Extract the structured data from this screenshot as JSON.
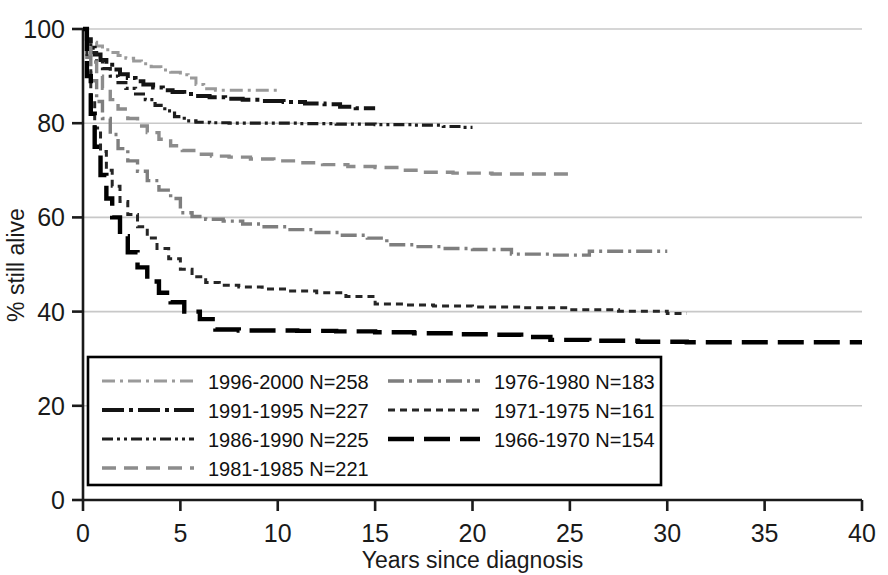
{
  "chart_data": {
    "type": "line",
    "title": "",
    "subtitle": "",
    "xlabel": "Years since diagnosis",
    "ylabel": "% still alive",
    "xlim": [
      0,
      40
    ],
    "ylim": [
      0,
      100
    ],
    "xticks": [
      0,
      5,
      10,
      15,
      20,
      25,
      30,
      35,
      40
    ],
    "yticks": [
      0,
      20,
      40,
      60,
      80,
      100
    ],
    "grid": "horizontal",
    "legend_position": "inside-bottom-left",
    "series": [
      {
        "name": "1996-2000 N=258",
        "period": "1996-2000",
        "n": 258,
        "dash": "dashdot",
        "color": "#9a9a9a",
        "width": 3.0,
        "points": [
          [
            0,
            100
          ],
          [
            0.2,
            98.5
          ],
          [
            0.4,
            97.2
          ],
          [
            0.7,
            96.4
          ],
          [
            1.0,
            95.6
          ],
          [
            1.4,
            95.0
          ],
          [
            1.8,
            94.4
          ],
          [
            2.2,
            93.8
          ],
          [
            2.6,
            93.2
          ],
          [
            3.0,
            92.6
          ],
          [
            3.5,
            92.0
          ],
          [
            4.0,
            91.3
          ],
          [
            4.5,
            90.8
          ],
          [
            5.0,
            90.3
          ],
          [
            5.4,
            89.6
          ],
          [
            5.8,
            88.2
          ],
          [
            6.2,
            87.3
          ],
          [
            6.8,
            87.0
          ],
          [
            7.5,
            87.0
          ],
          [
            8.5,
            87.0
          ],
          [
            9.4,
            87.0
          ],
          [
            10.0,
            87.0
          ]
        ]
      },
      {
        "name": "1991-1995 N=227",
        "period": "1991-1995",
        "n": 227,
        "dash": "longdashdot",
        "color": "#141414",
        "width": 4.0,
        "points": [
          [
            0,
            100
          ],
          [
            0.2,
            97.8
          ],
          [
            0.4,
            96.0
          ],
          [
            0.6,
            94.6
          ],
          [
            0.9,
            93.4
          ],
          [
            1.2,
            92.4
          ],
          [
            1.5,
            91.4
          ],
          [
            1.9,
            90.4
          ],
          [
            2.3,
            89.6
          ],
          [
            2.7,
            88.9
          ],
          [
            3.1,
            88.2
          ],
          [
            3.6,
            87.6
          ],
          [
            4.1,
            87.0
          ],
          [
            4.6,
            86.6
          ],
          [
            5.2,
            86.2
          ],
          [
            5.8,
            85.8
          ],
          [
            6.5,
            85.5
          ],
          [
            7.3,
            85.2
          ],
          [
            8.2,
            85.0
          ],
          [
            9.2,
            84.7
          ],
          [
            10.3,
            84.5
          ],
          [
            11.4,
            84.2
          ],
          [
            12.4,
            84.0
          ],
          [
            13.2,
            83.5
          ],
          [
            14.0,
            83.2
          ],
          [
            15.0,
            83.2
          ]
        ]
      },
      {
        "name": "1986-1990 N=225",
        "period": "1986-1990",
        "n": 225,
        "dash": "dashdotdot",
        "color": "#1d1d1d",
        "width": 3.2,
        "points": [
          [
            0,
            100
          ],
          [
            0.2,
            97.0
          ],
          [
            0.4,
            95.0
          ],
          [
            0.7,
            93.2
          ],
          [
            1.0,
            91.6
          ],
          [
            1.4,
            90.0
          ],
          [
            1.8,
            88.6
          ],
          [
            2.2,
            87.4
          ],
          [
            2.7,
            86.2
          ],
          [
            3.2,
            85.0
          ],
          [
            3.7,
            83.8
          ],
          [
            4.2,
            82.6
          ],
          [
            4.7,
            81.4
          ],
          [
            5.2,
            80.5
          ],
          [
            5.8,
            80.2
          ],
          [
            6.5,
            80.1
          ],
          [
            7.5,
            80.0
          ],
          [
            9.0,
            80.0
          ],
          [
            11.0,
            79.9
          ],
          [
            13.0,
            79.8
          ],
          [
            15.0,
            79.7
          ],
          [
            17.0,
            79.6
          ],
          [
            18.5,
            79.3
          ],
          [
            19.5,
            79.1
          ],
          [
            20.0,
            79.1
          ]
        ]
      },
      {
        "name": "1981-1985 N=221",
        "period": "1981-1985",
        "n": 221,
        "dash": "dashed",
        "color": "#8c8c8c",
        "width": 3.4,
        "points": [
          [
            0,
            100
          ],
          [
            0.2,
            96.0
          ],
          [
            0.4,
            93.0
          ],
          [
            0.7,
            90.0
          ],
          [
            1.0,
            87.4
          ],
          [
            1.4,
            85.0
          ],
          [
            1.8,
            83.0
          ],
          [
            2.3,
            81.0
          ],
          [
            2.8,
            79.4
          ],
          [
            3.3,
            78.0
          ],
          [
            3.9,
            76.6
          ],
          [
            4.5,
            75.2
          ],
          [
            5.1,
            74.2
          ],
          [
            5.8,
            73.4
          ],
          [
            6.6,
            73.0
          ],
          [
            7.5,
            72.8
          ],
          [
            8.6,
            72.4
          ],
          [
            9.8,
            72.0
          ],
          [
            11.0,
            71.6
          ],
          [
            12.3,
            71.2
          ],
          [
            13.6,
            70.8
          ],
          [
            15.0,
            70.6
          ],
          [
            16.3,
            70.0
          ],
          [
            17.5,
            69.6
          ],
          [
            19.0,
            69.4
          ],
          [
            21.0,
            69.2
          ],
          [
            23.0,
            69.2
          ],
          [
            25.0,
            69.2
          ]
        ]
      },
      {
        "name": "1976-1980 N=183",
        "period": "1976-1980",
        "n": 183,
        "dash": "dashdot-gray",
        "color": "#7e7e7e",
        "width": 3.4,
        "points": [
          [
            0,
            100
          ],
          [
            0.2,
            94.0
          ],
          [
            0.4,
            89.0
          ],
          [
            0.7,
            84.6
          ],
          [
            1.0,
            81.0
          ],
          [
            1.4,
            77.6
          ],
          [
            1.8,
            74.6
          ],
          [
            2.3,
            72.0
          ],
          [
            2.8,
            69.8
          ],
          [
            3.3,
            67.8
          ],
          [
            3.9,
            65.8
          ],
          [
            4.5,
            64.0
          ],
          [
            5.0,
            61.0
          ],
          [
            5.6,
            60.2
          ],
          [
            6.3,
            59.6
          ],
          [
            7.2,
            59.2
          ],
          [
            8.2,
            58.6
          ],
          [
            9.3,
            58.0
          ],
          [
            10.5,
            57.4
          ],
          [
            11.8,
            56.8
          ],
          [
            13.2,
            56.2
          ],
          [
            14.6,
            55.6
          ],
          [
            15.6,
            54.2
          ],
          [
            17.0,
            53.8
          ],
          [
            18.5,
            53.4
          ],
          [
            20.0,
            53.2
          ],
          [
            22.0,
            52.2
          ],
          [
            24.0,
            52.0
          ],
          [
            26.0,
            52.8
          ],
          [
            28.0,
            52.8
          ],
          [
            30.0,
            52.8
          ]
        ]
      },
      {
        "name": "1971-1975 N=161",
        "period": "1971-1975",
        "n": 161,
        "dash": "dotted",
        "color": "#262626",
        "width": 3.0,
        "points": [
          [
            0,
            100
          ],
          [
            0.2,
            92.0
          ],
          [
            0.4,
            85.0
          ],
          [
            0.6,
            79.0
          ],
          [
            0.9,
            74.0
          ],
          [
            1.2,
            70.0
          ],
          [
            1.5,
            66.6
          ],
          [
            1.9,
            63.4
          ],
          [
            2.3,
            60.6
          ],
          [
            2.8,
            58.0
          ],
          [
            3.3,
            55.6
          ],
          [
            3.8,
            53.4
          ],
          [
            4.4,
            51.2
          ],
          [
            5.0,
            49.0
          ],
          [
            5.6,
            47.4
          ],
          [
            6.3,
            46.2
          ],
          [
            7.0,
            45.6
          ],
          [
            8.0,
            45.2
          ],
          [
            9.2,
            44.8
          ],
          [
            10.5,
            44.4
          ],
          [
            12.0,
            44.0
          ],
          [
            13.5,
            43.2
          ],
          [
            15.0,
            41.6
          ],
          [
            16.5,
            41.4
          ],
          [
            18.0,
            41.2
          ],
          [
            20.0,
            41.0
          ],
          [
            22.5,
            40.8
          ],
          [
            25.0,
            40.4
          ],
          [
            27.5,
            40.1
          ],
          [
            30.0,
            39.6
          ],
          [
            31.0,
            39.6
          ]
        ]
      },
      {
        "name": "1966-1970 N=154",
        "period": "1966-1970",
        "n": 154,
        "dash": "longdash",
        "color": "#000000",
        "width": 4.4,
        "points": [
          [
            0,
            100
          ],
          [
            0.2,
            90.0
          ],
          [
            0.4,
            82.0
          ],
          [
            0.6,
            75.0
          ],
          [
            0.9,
            69.0
          ],
          [
            1.2,
            64.0
          ],
          [
            1.5,
            60.0
          ],
          [
            1.9,
            56.0
          ],
          [
            2.3,
            52.6
          ],
          [
            2.8,
            49.4
          ],
          [
            3.3,
            46.4
          ],
          [
            3.9,
            44.0
          ],
          [
            4.5,
            42.0
          ],
          [
            5.2,
            40.0
          ],
          [
            6.0,
            38.4
          ],
          [
            6.8,
            36.2
          ],
          [
            8.0,
            36.0
          ],
          [
            9.5,
            36.0
          ],
          [
            11.0,
            35.9
          ],
          [
            13.0,
            35.8
          ],
          [
            15.0,
            35.6
          ],
          [
            17.0,
            35.4
          ],
          [
            19.0,
            35.2
          ],
          [
            21.0,
            35.1
          ],
          [
            22.5,
            34.6
          ],
          [
            24.0,
            34.0
          ],
          [
            26.0,
            33.8
          ],
          [
            28.5,
            33.6
          ],
          [
            31.0,
            33.5
          ],
          [
            34.0,
            33.5
          ],
          [
            37.0,
            33.5
          ],
          [
            40.0,
            33.5
          ]
        ]
      }
    ]
  },
  "legend": {
    "column_left": [
      "1996-2000 N=258",
      "1991-1995 N=227",
      "1986-1990 N=225",
      "1981-1985 N=221"
    ],
    "column_right": [
      "1976-1980 N=183",
      "1971-1975 N=161",
      "1966-1970 N=154"
    ]
  },
  "axes": {
    "x_tick_labels": [
      "0",
      "5",
      "10",
      "15",
      "20",
      "25",
      "30",
      "35",
      "40"
    ],
    "y_tick_labels": [
      "0",
      "20",
      "40",
      "60",
      "80",
      "100"
    ],
    "x_title": "Years since diagnosis",
    "y_title": "% still alive"
  },
  "colors": {
    "axis": "#1a1a1a",
    "grid": "#c8c8c8",
    "background": "#ffffff",
    "legend_border": "#000000"
  }
}
